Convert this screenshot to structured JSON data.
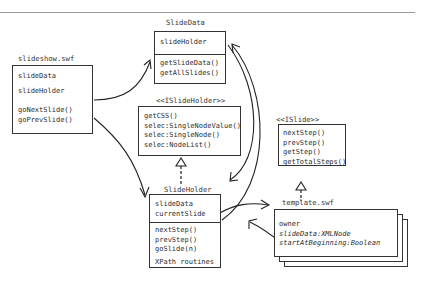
{
  "diagram": {
    "classes": {
      "slideshow": {
        "title": "slideshow.swf",
        "attributes": [
          "slideData",
          "slideHolder"
        ],
        "methods": [
          "goNextSlide()",
          "goPrevSlide()"
        ]
      },
      "slide_data": {
        "title": "SlideData",
        "attributes": [
          "slideHolder"
        ],
        "methods": [
          "getSlideData()",
          "getAllSlides()"
        ]
      },
      "islide_holder": {
        "title": "<<ISlideHolder>>",
        "methods": [
          "getCSS()",
          "selec:SingleNodeValue()",
          "selec:SingleNode()",
          "selec:NodeList()"
        ]
      },
      "slide_holder": {
        "title": "SlideHolder",
        "attributes": [
          "slideData",
          "currentSlide"
        ],
        "methods": [
          "nextStep()",
          "prevStep()",
          "goSlide(n)"
        ],
        "extra": "XPath routines"
      },
      "islide": {
        "title": "<<ISlide>>",
        "methods": [
          "nextStep()",
          "prevStep()",
          "getStep()",
          "getTotalSteps()"
        ]
      },
      "template": {
        "title": "template.swf",
        "attributes": [
          "owner",
          "slideData:XMLNode",
          "startAtBeginning:Boolean"
        ]
      }
    },
    "relations": [
      {
        "from": "slideshow.swf",
        "to": "SlideData",
        "type": "association"
      },
      {
        "from": "slideshow.swf",
        "to": "SlideHolder",
        "type": "association"
      },
      {
        "from": "SlideData",
        "to": "SlideHolder",
        "type": "association"
      },
      {
        "from": "SlideHolder",
        "to": "SlideData",
        "type": "association"
      },
      {
        "from": "SlideHolder",
        "to": "template.swf",
        "type": "association"
      },
      {
        "from": "template.swf",
        "to": "SlideHolder",
        "type": "association"
      },
      {
        "from": "SlideHolder",
        "to": "<<ISlideHolder>>",
        "type": "realization"
      },
      {
        "from": "template.swf",
        "to": "<<ISlide>>",
        "type": "realization"
      }
    ]
  }
}
